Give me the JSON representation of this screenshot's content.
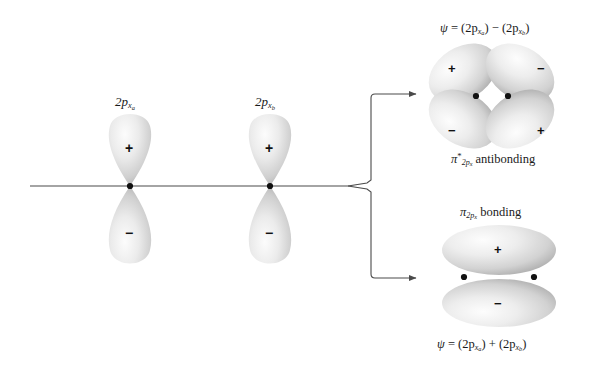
{
  "figure": {
    "background_color": "#ffffff",
    "orbital_fill_light": "#f2f2f2",
    "orbital_fill_mid": "#d8d8d8",
    "orbital_fill_dark": "#a8a8a8",
    "line_color": "#4a4a4a",
    "node_dot_color": "#111111",
    "text_color": "#1a1a1a"
  },
  "atomic_orbitals": [
    {
      "id": "2px-a",
      "label_plain": "2p x a",
      "label_prefix": "2p",
      "label_sub": "x",
      "label_subsub": "a",
      "top_lobe_sign": "+",
      "bottom_lobe_sign": "−",
      "node_dot": true
    },
    {
      "id": "2px-b",
      "label_plain": "2p x b",
      "label_prefix": "2p",
      "label_sub": "x",
      "label_subsub": "b",
      "top_lobe_sign": "+",
      "bottom_lobe_sign": "−",
      "node_dot": true
    }
  ],
  "molecular_orbitals": {
    "antibonding": {
      "equation_psi": "ψ",
      "equation_rest_1": " = (2p",
      "equation_sub_1": "x",
      "equation_subsub_1": "a",
      "equation_rest_2": ") − (2p",
      "equation_sub_2": "x",
      "equation_subsub_2": "b",
      "equation_rest_3": ")",
      "equation_plain": "ψ = (2p_xa) − (2p_xb)",
      "name_symbol": "π",
      "name_star": "*",
      "name_sub": "2p",
      "name_subsub": "x",
      "name_word": "antibonding",
      "name_plain": "π*2px antibonding",
      "lobes": [
        {
          "position": "top-left",
          "sign": "+"
        },
        {
          "position": "top-right",
          "sign": "−"
        },
        {
          "position": "bottom-left",
          "sign": "−"
        },
        {
          "position": "bottom-right",
          "sign": "+"
        }
      ],
      "node_dots": 2
    },
    "bonding": {
      "name_symbol": "π",
      "name_sub": "2p",
      "name_subsub": "x",
      "name_word": "bonding",
      "name_plain": "π2px bonding",
      "equation_psi": "ψ",
      "equation_rest_1": " = (2p",
      "equation_sub_1": "x",
      "equation_subsub_1": "a",
      "equation_rest_2": ") + (2p",
      "equation_sub_2": "x",
      "equation_subsub_2": "b",
      "equation_rest_3": ")",
      "equation_plain": "ψ = (2p_xa) + (2p_xb)",
      "lobes": [
        {
          "position": "top",
          "sign": "+"
        },
        {
          "position": "bottom",
          "sign": "−"
        }
      ],
      "node_dots": 2
    }
  },
  "connectors": {
    "axis_line_label": "internuclear axis",
    "branch_label": "combination fork",
    "arrow_up_target": "antibonding orbital",
    "arrow_down_target": "bonding orbital"
  }
}
